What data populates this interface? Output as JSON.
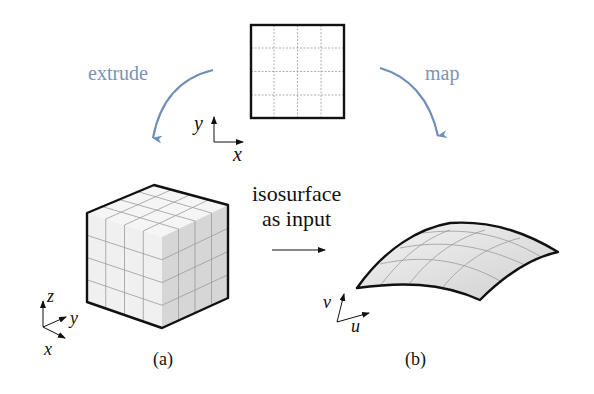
{
  "labels": {
    "extrude": "extrude",
    "map": "map",
    "iso_line1": "isosurface",
    "iso_line2": "as input",
    "caption_a": "(a)",
    "caption_b": "(b)"
  },
  "axes": {
    "square": {
      "x": "x",
      "y": "y"
    },
    "cube": {
      "x": "x",
      "y": "y",
      "z": "z"
    },
    "surface": {
      "u": "u",
      "v": "v"
    }
  },
  "colors": {
    "arrow_blue": "#6f8fb8",
    "label_blue": "#7a93b3",
    "outline": "#111111",
    "grid": "#9a9a9a",
    "cube_side": "#d8d8d8",
    "cube_face": "#f2f2f2",
    "surface_fill": "#e6e6e6"
  },
  "grid": {
    "square_divisions": 4,
    "cube_divisions": 4,
    "surface_divisions": 4
  }
}
